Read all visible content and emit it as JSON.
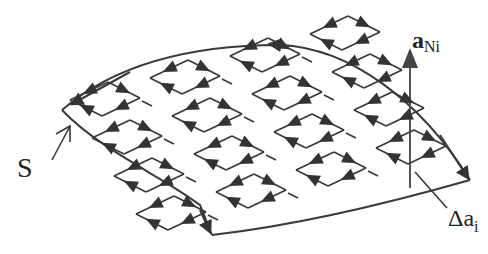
{
  "diagram": {
    "type": "surface-circulation-diagram",
    "labels": {
      "surface": "S",
      "normal_vector_bold": "a",
      "normal_vector_sub": "Ni",
      "area_element_prefix": "Δa",
      "area_element_sub": "i"
    },
    "colors": {
      "stroke": "#3a3a3a",
      "arrowhead": "#333333",
      "background": "#ffffff"
    },
    "grid": {
      "rows": 4,
      "cols": 4,
      "cell_description": "small parallelogram loops with circulating arrows; adjacent edges cancel"
    },
    "boundary": {
      "description": "curved surface boundary with counter-clockwise arrows"
    }
  }
}
